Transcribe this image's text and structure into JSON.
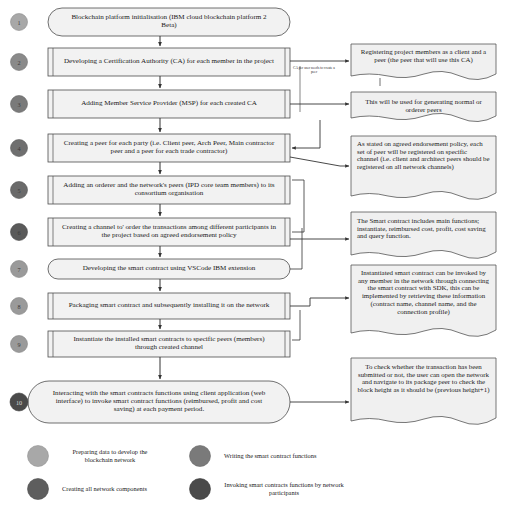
{
  "diagram": {
    "colors": {
      "node_fill": "#f2f2f2",
      "node_stroke": "#4d4d4d",
      "note_fill": "#f0f0f0",
      "note_stroke": "#555555",
      "connector": "#333333",
      "legend_light_gray": "#a8a8a8",
      "legend_mid_gray": "#7a7a7a",
      "legend_dark_gray": "#5a5a5a",
      "legend_darkest_gray": "#4a4a4a"
    },
    "steps": [
      {
        "number": "1",
        "shape": "terminator",
        "marker_color": "#a8a8a8",
        "text": "Blockchain platform initialisation (IBM cloud blockchain platform 2 Beta)"
      },
      {
        "number": "2",
        "shape": "predefined-process",
        "marker_color": "#8a8a8a",
        "text": "Developing a Certification Authority (CA) for each  member in the project"
      },
      {
        "number": "3",
        "shape": "predefined-process",
        "marker_color": "#7a7a7a",
        "text": "Adding Member Service Provider (MSP) for each created CA"
      },
      {
        "number": "4",
        "shape": "predefined-process",
        "marker_color": "#6f6f6f",
        "text": "Creating a peer for each party (i.e. Client peer, Arch Peer, Main contractor peer and a peer for each trade contractor)"
      },
      {
        "number": "5",
        "shape": "predefined-process",
        "marker_color": "#6a6a6a",
        "text": "Adding an orderer and the network's peers (IPD core team members) to its consortium organisation"
      },
      {
        "number": "6",
        "shape": "predefined-process",
        "marker_color": "#5a5a5a",
        "text": "Creating a channel to' order the transactions among different participants in the project based on agreed endorsement policy"
      },
      {
        "number": "7",
        "shape": "terminator",
        "marker_color": "#9a9a9a",
        "text": "Developing the smart contract using VSCode IBM extension"
      },
      {
        "number": "8",
        "shape": "predefined-process",
        "marker_color": "#9a9a9a",
        "text": "Packaging smart contract and subsequently installing it on the network"
      },
      {
        "number": "9",
        "shape": "predefined-process",
        "marker_color": "#9a9a9a",
        "text": "Instantiate the installed smart contracts to specific peers (members) through created channel"
      },
      {
        "number": "10",
        "shape": "terminator",
        "marker_color": "#4a4a4a",
        "text": "Interacting with the smart contracts functions using client application (web interface) to invoke smart contract functions (reimbursed, profit and cost saving) at each payment period."
      }
    ],
    "notes": [
      {
        "id": "note-register-members",
        "text": "Registering project members as a client and a peer (the peer that will use this CA)"
      },
      {
        "id": "note-generating-peers",
        "text": "This will be used for generating normal or orderer peers"
      },
      {
        "id": "note-endorsement-policy",
        "text": "As stated on agreed endorsement policy, each set of peer will be registered on specific channel (i.e. client and architect peers should be registered on all network channels)"
      },
      {
        "id": "note-smart-contract-functions",
        "text": "The Smart contract includes main functions; instantiate, reimbursed cost, profit, cost saving and query function."
      },
      {
        "id": "note-sdk-invocation",
        "text": "Instantiated smart contract can be invoked by any member in the network through connecting the smart contract with SDK, this can be implemented by retrieving these information (contract name, channel name, and the connection profile)"
      },
      {
        "id": "note-block-height",
        "text": "To check whether the transaction has been submitted or not, the user can open the network and navigate to its package peer to check the block height as it should be (previous height+1)"
      }
    ],
    "edge_labels": [
      {
        "id": "edge-ca-per-user",
        "text": "CA per user needs to create a peer"
      }
    ],
    "legend": [
      {
        "id": "legend-preparing-data",
        "color": "#a8a8a8",
        "label": "Preparing data to develop the blockchain network"
      },
      {
        "id": "legend-writing-smart-contract",
        "color": "#7a7a7a",
        "label": "Writing the smart contract functions"
      },
      {
        "id": "legend-creating-components",
        "color": "#5e5e5e",
        "label": "Creating all network components"
      },
      {
        "id": "legend-invoking-functions",
        "color": "#4a4a4a",
        "label": "Invoking smart contracts functions by network participants"
      }
    ]
  }
}
